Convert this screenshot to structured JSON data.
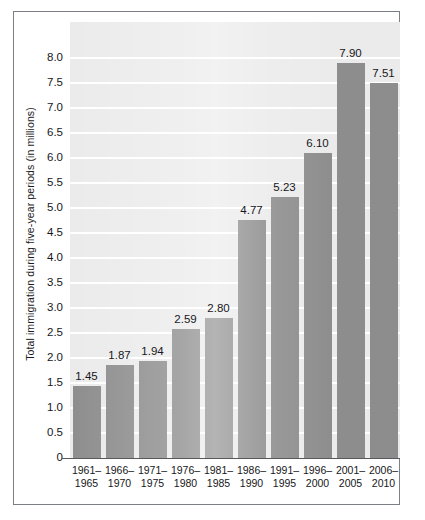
{
  "chart_data": {
    "type": "bar",
    "title": "",
    "xlabel": "",
    "ylabel": "Total immigration during five-year periods (in millions)",
    "categories": [
      "1961–1965",
      "1966–1970",
      "1971–1975",
      "1976–1980",
      "1981–1985",
      "1986–1990",
      "1991–1995",
      "1996–2000",
      "2001–2005",
      "2006–2010"
    ],
    "category_lines": [
      [
        "1961–",
        "1965"
      ],
      [
        "1966–",
        "1970"
      ],
      [
        "1971–",
        "1975"
      ],
      [
        "1976–",
        "1980"
      ],
      [
        "1981–",
        "1985"
      ],
      [
        "1986–",
        "1990"
      ],
      [
        "1991–",
        "1995"
      ],
      [
        "1996–",
        "2000"
      ],
      [
        "2001–",
        "2005"
      ],
      [
        "2006–",
        "2010"
      ]
    ],
    "values": [
      1.45,
      1.87,
      1.94,
      2.59,
      2.8,
      4.77,
      5.23,
      6.1,
      7.9,
      7.51
    ],
    "value_labels": [
      "1.45",
      "1.87",
      "1.94",
      "2.59",
      "2.80",
      "4.77",
      "5.23",
      "6.10",
      "7.90",
      "7.51"
    ],
    "ylim": [
      0,
      8.72
    ],
    "ytick_values": [
      0,
      0.5,
      1.0,
      1.5,
      2.0,
      2.5,
      3.0,
      3.5,
      4.0,
      4.5,
      5.0,
      5.5,
      6.0,
      6.5,
      7.0,
      7.5,
      8.0
    ],
    "ytick_labels": [
      "0",
      "0.5",
      "1.0",
      "1.5",
      "2.0",
      "2.5",
      "3.0",
      "3.5",
      "4.0",
      "4.5",
      "5.0",
      "5.5",
      "6.0",
      "6.5",
      "7.0",
      "7.5",
      "8.0"
    ],
    "grid": true,
    "grid_color": "#ffffff",
    "legend": false,
    "bar_color": "#8d8d8d",
    "plot_background": "#ebebeb",
    "figure_background": "#ffffff",
    "border_color": "#7d7f86",
    "text_color": "#17171a"
  }
}
